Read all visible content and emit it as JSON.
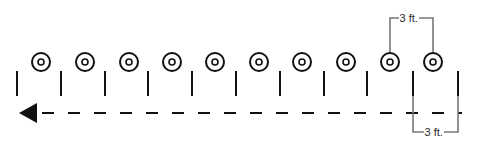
{
  "diagram": {
    "colors": {
      "stroke": "#111111",
      "bracket": "#777777",
      "background": "#ffffff"
    },
    "targets": {
      "count": 10,
      "x": [
        41,
        85,
        129,
        172,
        215,
        259,
        302,
        346,
        390,
        433
      ],
      "y": 62,
      "outer_radius": 9,
      "inner_radius": 3
    },
    "posts": {
      "x": [
        17,
        61,
        105,
        148,
        192,
        236,
        280,
        324,
        367,
        413,
        458
      ],
      "y1": 71,
      "y2": 96
    },
    "path": {
      "y": 113,
      "x_start": 42,
      "x_end": 462,
      "dash": 12,
      "gap": 14,
      "arrow_direction": "left",
      "arrow_tip_x": 19
    },
    "top_dimension": {
      "label": "3 ft.",
      "x1": 390,
      "x2": 433,
      "y": 18
    },
    "bottom_dimension": {
      "label": "3 ft.",
      "x1": 413,
      "x2": 458,
      "y": 132
    }
  }
}
